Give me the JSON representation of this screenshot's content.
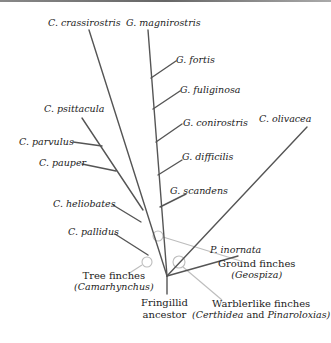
{
  "diagram": {
    "type": "phylogenetic-tree",
    "colors": {
      "branch": "#555555",
      "annotation": "#b8b8b8",
      "text": "#222222"
    },
    "root": {
      "label_line1": "Fringillid",
      "label_line2": "ancestor"
    },
    "species": {
      "crassirostris": "C. crassirostris",
      "magnirostris": "G. magnirostris",
      "fortis": "G. fortis",
      "fuliginosa": "G. fuliginosa",
      "conirostris": "G. conirostris",
      "difficilis": "G. difficilis",
      "scandens": "G. scandens",
      "olivacea": "C. olivacea",
      "psittacula": "C. psittacula",
      "parvulus": "C. parvulus",
      "pauper": "C. pauper",
      "heliobates": "C. heliobates",
      "pallidus": "C. pallidus",
      "inornata": "P. inornata"
    },
    "groups": {
      "tree": {
        "name": "Tree finches",
        "genus": "(Camarhynchus)"
      },
      "ground": {
        "name": "Ground finches",
        "genus": "(Geospiza)"
      },
      "warbler": {
        "name": "Warblerlike finches",
        "genus_a": "(Certhidea",
        "and": "and",
        "genus_b": "Pinaroloxias)"
      }
    }
  }
}
